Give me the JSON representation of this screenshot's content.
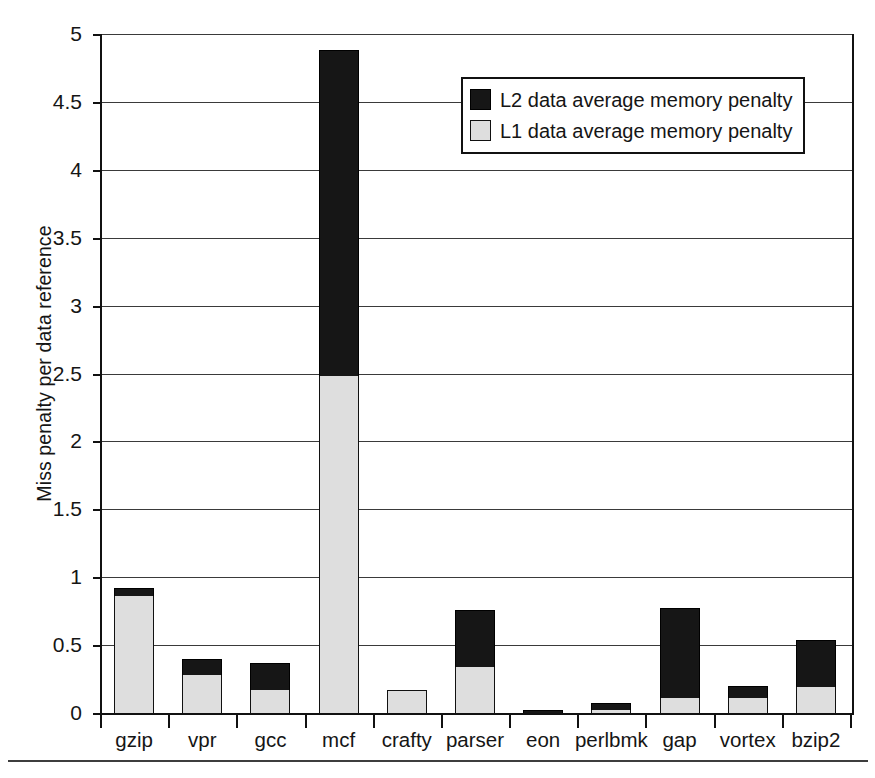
{
  "chart_data": {
    "type": "bar",
    "subtype": "stacked-vertical",
    "title": "",
    "xlabel": "",
    "ylabel": "Miss penalty per data reference",
    "ylim": [
      0,
      5
    ],
    "ytick_step": 0.5,
    "ytick_labels": [
      "0",
      "0.5",
      "1",
      "1.5",
      "2",
      "2.5",
      "3",
      "3.5",
      "4",
      "4.5",
      "5"
    ],
    "ytick_values": [
      0,
      0.5,
      1,
      1.5,
      2,
      2.5,
      3,
      3.5,
      4,
      4.5,
      5
    ],
    "grid": "horizontal",
    "legend_position": "inside-top-center",
    "categories": [
      "gzip",
      "vpr",
      "gcc",
      "mcf",
      "crafty",
      "parser",
      "eon",
      "perlbmk",
      "gap",
      "vortex",
      "bzip2"
    ],
    "series": [
      {
        "name": "L1 data average memory penalty",
        "color": "#dedede",
        "values": [
          0.86,
          0.28,
          0.17,
          2.48,
          0.17,
          0.34,
          0.0,
          0.01,
          0.11,
          0.11,
          0.19
        ]
      },
      {
        "name": "L2 data average memory penalty",
        "color": "#161616",
        "values": [
          0.06,
          0.12,
          0.2,
          2.4,
          0.0,
          0.42,
          0.02,
          0.05,
          0.66,
          0.09,
          0.35
        ]
      }
    ],
    "totals": [
      0.92,
      0.4,
      0.37,
      4.88,
      0.17,
      0.76,
      0.02,
      0.06,
      0.77,
      0.2,
      0.54
    ],
    "stack_order_bottom_to_top": [
      "L1 data average memory penalty",
      "L2 data average memory penalty"
    ]
  },
  "legend": {
    "entries": [
      {
        "label": "L2 data average memory penalty",
        "swatch": "black-swatch-icon"
      },
      {
        "label": "L1 data average memory penalty",
        "swatch": "light-gray-swatch-icon"
      }
    ]
  },
  "axes": {
    "y_title": "Miss penalty per data reference"
  },
  "colors": {
    "l1_fill": "#dedede",
    "l2_fill": "#161616",
    "axis": "#111111",
    "gridline": "#3a3a3a",
    "background": "#ffffff"
  }
}
